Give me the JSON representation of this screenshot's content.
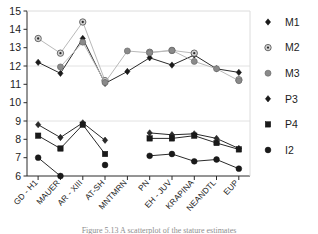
{
  "chart_data": {
    "type": "line",
    "title": "",
    "xlabel": "",
    "ylabel": "",
    "ylim": [
      6,
      15
    ],
    "ytick_step": 1,
    "yticks": [
      "15",
      "14",
      "13",
      "12",
      "11",
      "10",
      "9",
      "8",
      "7",
      "6"
    ],
    "gridlines": [
      12,
      9
    ],
    "grid": "horizontal-faint",
    "legend_position": "right",
    "categories": [
      "GD - H1",
      "MAUER",
      "AR - XIII",
      "AT-SH",
      "MNTMRN",
      "PN",
      "EH - JUV",
      "KRAPINA",
      "NEANDTL",
      "EUP"
    ],
    "series": [
      {
        "name": "M1",
        "marker": "diamond-filled",
        "color": "#1a1a1a",
        "values": [
          12.2,
          11.6,
          13.5,
          11.05,
          11.7,
          12.45,
          12.05,
          12.6,
          11.85,
          11.65
        ]
      },
      {
        "name": "M2",
        "marker": "circle-dotted",
        "color": "#9a9a9a",
        "values": [
          13.5,
          12.7,
          14.4,
          11.2,
          null,
          12.75,
          12.85,
          12.7,
          null,
          11.25
        ]
      },
      {
        "name": "M3",
        "marker": "circle-gray",
        "color": "#808080",
        "values": [
          null,
          11.95,
          13.3,
          11.1,
          12.82,
          12.72,
          12.85,
          12.25,
          11.85,
          11.2
        ]
      },
      {
        "name": "P3",
        "marker": "diamond-dark",
        "color": "#2b2b2b",
        "values": [
          8.8,
          8.1,
          8.9,
          7.95,
          null,
          8.35,
          8.25,
          8.3,
          8.05,
          7.5
        ]
      },
      {
        "name": "P4",
        "marker": "square",
        "color": "#1a1a1a",
        "values": [
          8.2,
          7.5,
          8.8,
          7.2,
          null,
          8.05,
          8.05,
          8.2,
          7.8,
          7.45
        ]
      },
      {
        "name": "I2",
        "marker": "circle-filled",
        "color": "#1a1a1a",
        "values": [
          7.0,
          6.0,
          null,
          6.6,
          null,
          7.1,
          7.2,
          6.8,
          6.9,
          6.4
        ]
      }
    ]
  },
  "legend": {
    "entries": [
      {
        "label": "M1",
        "marker": "diamond-filled"
      },
      {
        "label": "M2",
        "marker": "circle-dotted"
      },
      {
        "label": "M3",
        "marker": "circle-gray"
      },
      {
        "label": "P3",
        "marker": "diamond-dark"
      },
      {
        "label": "P4",
        "marker": "square"
      },
      {
        "label": "I2",
        "marker": "circle-filled"
      }
    ]
  },
  "caption": {
    "text": "Figure 5.13 A scatterplot of the stature estimates"
  }
}
